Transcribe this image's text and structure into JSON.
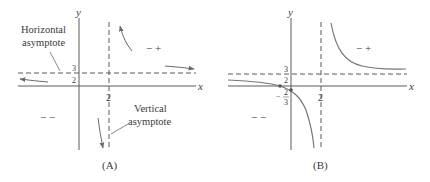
{
  "panels": [
    {
      "id": "A",
      "caption": "(A)",
      "axis_x_label": "x",
      "axis_y_label": "y",
      "h_asymptote_value_num": "3",
      "h_asymptote_value_den": "2",
      "v_asymptote_value": "2",
      "annotation_horizontal_line1": "Horizontal",
      "annotation_horizontal_line2": "asymptote",
      "annotation_vertical_line1": "Vertical",
      "annotation_vertical_line2": "asymptote",
      "sign_upper_right": "− +",
      "sign_lower_left": "− −"
    },
    {
      "id": "B",
      "caption": "(B)",
      "axis_x_label": "x",
      "axis_y_label": "y",
      "h_asymptote_value_num": "3",
      "h_asymptote_value_den": "2",
      "v_asymptote_value": "2",
      "y_intercept_num": "2",
      "y_intercept_den": "3",
      "y_intercept_sign": "−",
      "sign_upper_right": "− +",
      "sign_lower_left": "− −"
    }
  ],
  "colors": {
    "axis": "#5a5a5a",
    "curve": "#777777",
    "text": "#3a3a3a"
  }
}
